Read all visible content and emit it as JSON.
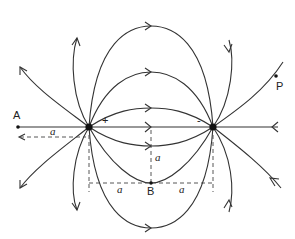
{
  "figure": {
    "charges": [
      {
        "id": "positive",
        "sign": "+",
        "x": 89,
        "y": 127
      },
      {
        "id": "negative",
        "sign": "-",
        "x": 213,
        "y": 127
      }
    ],
    "points": [
      {
        "id": "A",
        "label": "A",
        "x": 18,
        "y": 127
      },
      {
        "id": "P",
        "label": "P",
        "x": 276,
        "y": 76
      },
      {
        "id": "B",
        "label": "B",
        "x": 151,
        "y": 183
      }
    ],
    "dimensions": [
      {
        "id": "dist-A",
        "label": "a",
        "description": "distance from A to + charge"
      },
      {
        "id": "dist-B-vertical",
        "label": "a",
        "description": "distance of B below axis"
      },
      {
        "id": "dist-B-left",
        "label": "a",
        "description": "half-separation, left"
      },
      {
        "id": "dist-B-right",
        "label": "a",
        "description": "half-separation, right"
      }
    ],
    "colors": {
      "line": "#333333",
      "background": "#ffffff"
    }
  }
}
